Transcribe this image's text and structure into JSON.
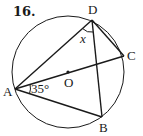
{
  "problem": {
    "number": "16."
  },
  "diagram": {
    "center": {
      "label": "O",
      "x": 68,
      "y": 72
    },
    "radius": 56,
    "points": [
      {
        "label": "A",
        "x": 15,
        "y": 89
      },
      {
        "label": "B",
        "x": 102,
        "y": 117
      },
      {
        "label": "C",
        "x": 124,
        "y": 56
      },
      {
        "label": "D",
        "x": 92,
        "y": 20
      }
    ],
    "segments": [
      "AD",
      "AC",
      "AB",
      "DC",
      "DB"
    ],
    "angles": [
      {
        "vertex": "A",
        "between": [
          "AC",
          "AB"
        ],
        "label": "35°"
      },
      {
        "vertex": "D",
        "between": [
          "DA",
          "DB"
        ],
        "label": "x"
      }
    ],
    "line_color": "#1a1a1a"
  }
}
